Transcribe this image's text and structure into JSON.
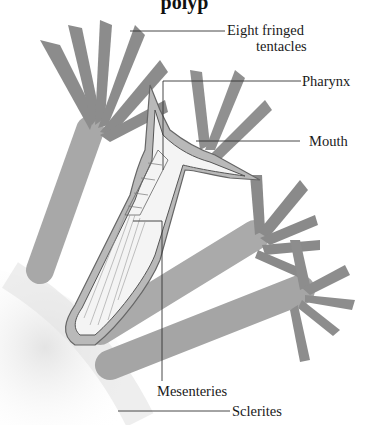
{
  "diagram": {
    "title_partial": "polyp",
    "labels": {
      "tentacles_line1": "Eight fringed",
      "tentacles_line2": "tentacles",
      "pharynx": "Pharynx",
      "mouth": "Mouth",
      "mesenteries": "Mesenteries",
      "sclerites": "Sclerites"
    },
    "colors": {
      "tissue": "#8f8f8f",
      "tissue_light": "#b5b5b5",
      "outline": "#555555",
      "leader_line": "#333333",
      "text": "#1a1a1a"
    }
  }
}
